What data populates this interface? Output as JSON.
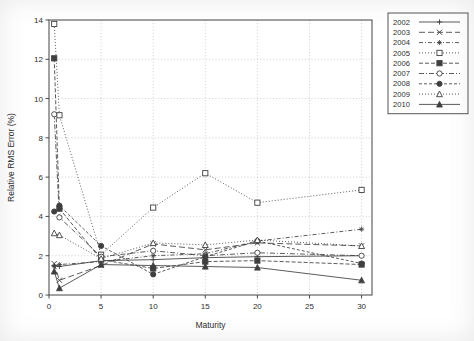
{
  "chart_data": {
    "type": "line",
    "title": "",
    "xlabel": "Maturity",
    "ylabel": "Relative RMS Error (%)",
    "xlim": [
      0,
      31
    ],
    "ylim": [
      0,
      14
    ],
    "xticks": [
      0,
      5,
      10,
      15,
      20,
      25,
      30
    ],
    "yticks": [
      0,
      2,
      4,
      6,
      8,
      10,
      12,
      14
    ],
    "xtick_labels": [
      "0",
      "5",
      "10",
      "15",
      "20",
      "25",
      "30"
    ],
    "ytick_labels": [
      "0",
      "2",
      "4",
      "6",
      "8",
      "10",
      "12",
      "14"
    ],
    "grid": true,
    "legend_position": "upper right",
    "x": [
      0.5,
      1,
      5,
      10,
      15,
      20,
      30
    ],
    "series": [
      {
        "name": "2002",
        "marker": "plus",
        "dash": "none",
        "values": [
          1.5,
          1.45,
          1.75,
          1.8,
          1.9,
          1.95,
          2.0
        ]
      },
      {
        "name": "2003",
        "marker": "x",
        "dash": "6 3",
        "values": [
          1.6,
          0.75,
          1.5,
          2.6,
          2.3,
          2.65,
          2.5
        ]
      },
      {
        "name": "2004",
        "marker": "star",
        "dash": "4 2 1 2",
        "values": [
          1.45,
          1.55,
          1.7,
          2.0,
          2.1,
          2.75,
          3.35
        ]
      },
      {
        "name": "2005",
        "marker": "open-square",
        "dash": "1 2",
        "values": [
          13.8,
          9.15,
          2.05,
          4.45,
          6.2,
          4.7,
          5.35
        ]
      },
      {
        "name": "2006",
        "marker": "filled-square",
        "dash": "4 2",
        "values": [
          12.05,
          4.4,
          1.8,
          1.35,
          1.7,
          1.75,
          1.55
        ]
      },
      {
        "name": "2007",
        "marker": "open-circle",
        "dash": "5 2 1 2",
        "values": [
          9.2,
          3.95,
          1.95,
          2.25,
          2.0,
          2.15,
          2.0
        ]
      },
      {
        "name": "2008",
        "marker": "filled-circle",
        "dash": "3 2",
        "values": [
          4.25,
          4.55,
          2.5,
          1.05,
          1.95,
          2.75,
          1.6
        ]
      },
      {
        "name": "2009",
        "marker": "open-triangle",
        "dash": "1 2",
        "values": [
          3.15,
          3.05,
          1.85,
          2.65,
          2.55,
          2.8,
          2.5
        ]
      },
      {
        "name": "2010",
        "marker": "filled-triangle",
        "dash": "none",
        "values": [
          1.2,
          0.35,
          1.55,
          1.5,
          1.45,
          1.4,
          0.75
        ]
      }
    ],
    "legend_entries": [
      "2002",
      "2003",
      "2004",
      "2005",
      "2006",
      "2007",
      "2008",
      "2009",
      "2010"
    ]
  },
  "colors": {
    "axis": "#4a4a4a",
    "grid": "#b9b9b9",
    "line": "#3f3f3f",
    "text": "#2e2e2e",
    "background": "#ffffff"
  }
}
